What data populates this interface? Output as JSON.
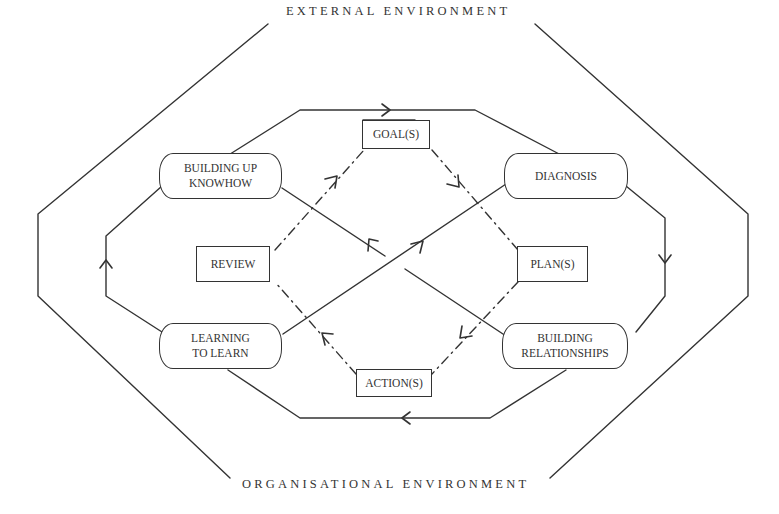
{
  "diagram": {
    "outer_labels": {
      "top": "EXTERNAL ENVIRONMENT",
      "bottom": "ORGANISATIONAL ENVIRONMENT"
    },
    "outer_loop_nodes": [
      {
        "id": "building-up-knowhow",
        "label_line1": "BUILDING UP",
        "label_line2": "KNOWHOW"
      },
      {
        "id": "diagnosis",
        "label_line1": "DIAGNOSIS",
        "label_line2": ""
      },
      {
        "id": "building-relationships",
        "label_line1": "BUILDING",
        "label_line2": "RELATIONSHIPS"
      },
      {
        "id": "learning-to-learn",
        "label_line1": "LEARNING",
        "label_line2": "TO LEARN"
      }
    ],
    "inner_cycle_nodes": [
      {
        "id": "goals",
        "label": "GOAL(S)"
      },
      {
        "id": "plans",
        "label": "PLAN(S)"
      },
      {
        "id": "actions",
        "label": "ACTION(S)"
      },
      {
        "id": "review",
        "label": "REVIEW"
      }
    ],
    "flows": [
      {
        "from": "building-up-knowhow",
        "to": "diagnosis",
        "style": "solid",
        "arrow": "top-center, pointing right"
      },
      {
        "from": "diagnosis",
        "to": "building-relationships",
        "style": "solid",
        "arrow": "right side, pointing down"
      },
      {
        "from": "building-relationships",
        "to": "learning-to-learn",
        "style": "solid",
        "arrow": "bottom-center, pointing left"
      },
      {
        "from": "learning-to-learn",
        "to": "building-up-knowhow",
        "style": "solid",
        "arrow": "left side, pointing up"
      },
      {
        "from": "learning-to-learn",
        "to": "diagnosis",
        "style": "solid-diagonal",
        "arrow": "pointing up-right"
      },
      {
        "from": "building-relationships",
        "to": "building-up-knowhow",
        "style": "solid-diagonal",
        "arrow": "pointing up-left"
      },
      {
        "from": "review",
        "to": "goals",
        "style": "dash-dot"
      },
      {
        "from": "goals",
        "to": "plans",
        "style": "dash-dot"
      },
      {
        "from": "plans",
        "to": "actions",
        "style": "dash-dot"
      },
      {
        "from": "actions",
        "to": "review",
        "style": "dash-dot"
      }
    ],
    "colors": {
      "line": "#333333",
      "background": "#ffffff"
    }
  }
}
